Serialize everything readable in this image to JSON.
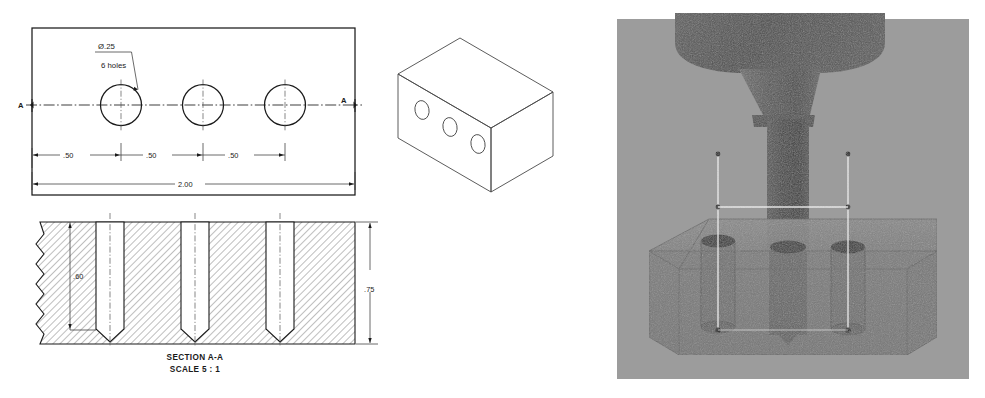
{
  "document": {
    "kind": "engineering-drawing",
    "views": [
      {
        "name": "top-view",
        "label": ""
      },
      {
        "name": "isometric-view",
        "label": ""
      },
      {
        "name": "section-view",
        "label": "SECTION A-A"
      },
      {
        "name": "cam-simulation-render",
        "label": ""
      }
    ]
  },
  "top_view": {
    "hole_callout": {
      "diameter": "Ø.25",
      "quantity": "6 holes"
    },
    "section_marks": {
      "left_letter": "A",
      "right_letter": "A"
    },
    "dimensions": {
      "spacing_1": ".50",
      "spacing_2": ".50",
      "spacing_3": ".50",
      "overall_length": "2.00"
    }
  },
  "section_view": {
    "caption_line_1": "SECTION A-A",
    "caption_line_2": "SCALE 5 : 1",
    "dimensions": {
      "hole_depth": ".60",
      "part_thickness": ".75"
    }
  },
  "render": {
    "background_color": "#9a9a9a",
    "stock_color": "#7a7a7a",
    "tool_color": "#4f4f4f",
    "spindle_color": "#5e5e5e",
    "toolpath_color": "#e8e8e8"
  },
  "colors": {
    "line": "#1a1a1a",
    "thin_line": "#3a3a3a",
    "paper": "#ffffff"
  }
}
